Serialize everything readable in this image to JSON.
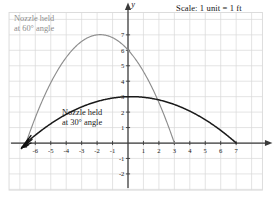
{
  "figure": {
    "scale_note": "Scale: 1 unit = 1 ft",
    "axis_label_x": "x",
    "axis_label_y": "y"
  },
  "annotations": {
    "high_arc": {
      "line1": "Nozzle held",
      "line2": "at 60° angle",
      "color": "#8d8d8d"
    },
    "low_arc": {
      "line1": "Nozzle held",
      "line2": "at 30° angle",
      "color": "#1a1a1a"
    }
  },
  "colors": {
    "grid": "#d9d9d9",
    "axis": "#3a3a3a",
    "curve_60": "#8d8d8d",
    "curve_30": "#1a1a1a",
    "nozzle": "#111111",
    "text": "#161616"
  },
  "chart_data": {
    "type": "line",
    "title": "Scale: 1 unit = 1 ft",
    "xlabel": "x",
    "ylabel": "y",
    "grid": true,
    "legend": "annotations-inline",
    "xlim": [
      -7.7,
      8.7
    ],
    "ylim": [
      -3.05,
      8.45
    ],
    "xticks": [
      -6,
      -5,
      -4,
      -3,
      -2,
      -1,
      1,
      2,
      3,
      4,
      5,
      6,
      7
    ],
    "xticklabels": [
      "-6",
      "-5",
      "-4",
      "-3",
      "-2",
      "-1",
      "1",
      "2",
      "3",
      "4",
      "5",
      "6",
      "7"
    ],
    "yticks": [
      1,
      2,
      3,
      4,
      5,
      6,
      7,
      -1,
      -2
    ],
    "yticklabels": [
      "1",
      "2",
      "3",
      "4",
      "5",
      "6",
      "7",
      "-1",
      "-2"
    ],
    "nozzle_point": [
      -6.6,
      0
    ],
    "series": [
      {
        "name": "Nozzle held at 60° angle",
        "color": "#8d8d8d",
        "vertex": [
          -2.0,
          7.0
        ],
        "roots": [
          -6.6,
          3.0
        ],
        "equation": "y = -0.3043(x + 6.6)(x - 3)",
        "x": [
          -6.6,
          -6.0,
          -5.0,
          -4.0,
          -3.0,
          -2.0,
          -1.0,
          0.0,
          1.0,
          2.0,
          3.0
        ],
        "y": [
          0.0,
          1.75,
          4.26,
          6.08,
          7.21,
          7.65,
          7.39,
          6.44,
          4.81,
          2.47,
          0.0
        ]
      },
      {
        "name": "Nozzle held at 30° angle",
        "color": "#1a1a1a",
        "vertex": [
          0.2,
          3.0
        ],
        "roots": [
          -6.6,
          7.0
        ],
        "equation": "y = -0.0688(x + 6.6)(x - 7)",
        "x": [
          -6.6,
          -6.0,
          -5.0,
          -4.0,
          -3.0,
          -2.0,
          -1.0,
          0.0,
          1.0,
          2.0,
          3.0,
          4.0,
          5.0,
          6.0,
          7.0
        ],
        "y": [
          0.0,
          0.54,
          1.38,
          2.08,
          2.64,
          3.06,
          3.33,
          3.47,
          3.47,
          3.33,
          3.06,
          2.64,
          2.08,
          1.38,
          0.0
        ]
      }
    ]
  }
}
